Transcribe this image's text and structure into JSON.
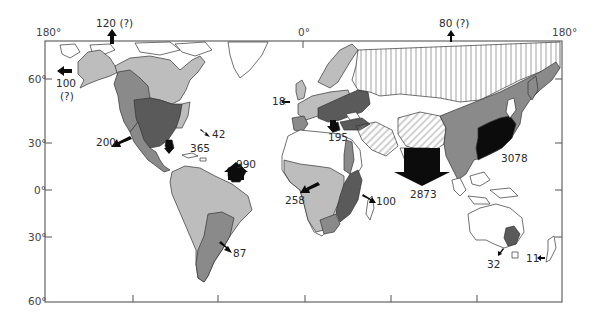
{
  "map": {
    "type": "world-map-flow",
    "frame": {
      "left_lon": "180°",
      "center_lon": "0°",
      "right_lon": "180°"
    },
    "latitude_labels": [
      "60°",
      "30°",
      "0°",
      "30°",
      "60°"
    ],
    "colors": {
      "light_grey": "#bdbdbd",
      "mid_grey": "#8a8a8a",
      "dark_grey": "#5a5a5a",
      "black": "#0c0c0c",
      "hatch": "#9a9a9a",
      "outline": "#333333"
    },
    "flows": [
      {
        "id": "arctic-north-america",
        "label": "120 (?)",
        "direction": "north"
      },
      {
        "id": "alaska-west",
        "label_line1": "100",
        "label_line2": "(?)",
        "direction": "west"
      },
      {
        "id": "north-america-pacific",
        "label": "200",
        "direction": "southwest"
      },
      {
        "id": "north-america-atlantic",
        "label": "42",
        "direction": "southeast"
      },
      {
        "id": "gulf-of-mexico",
        "label": "365",
        "direction": "south"
      },
      {
        "id": "amazon",
        "label": "990",
        "direction": "northeast"
      },
      {
        "id": "south-america-atlantic",
        "label": "87",
        "direction": "southeast"
      },
      {
        "id": "europe-atlantic",
        "label": "18",
        "direction": "west"
      },
      {
        "id": "mediterranean",
        "label": "195",
        "direction": "south"
      },
      {
        "id": "congo",
        "label": "258",
        "direction": "southwest"
      },
      {
        "id": "east-africa",
        "label": "100",
        "direction": "southeast"
      },
      {
        "id": "south-asia",
        "label": "2873",
        "direction": "south"
      },
      {
        "id": "east-asia",
        "label": "3078",
        "direction": "southeast"
      },
      {
        "id": "siberia-arctic",
        "label": "80 (?)",
        "direction": "north"
      },
      {
        "id": "australia",
        "label": "32",
        "direction": "southwest"
      },
      {
        "id": "new-zealand",
        "label": "11",
        "direction": "west"
      }
    ]
  }
}
